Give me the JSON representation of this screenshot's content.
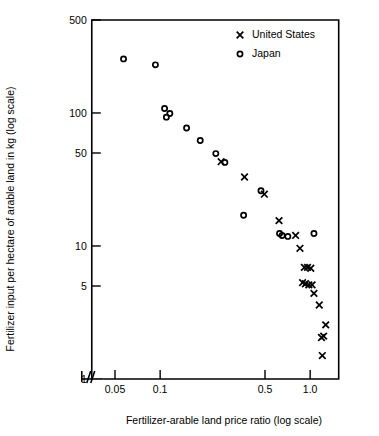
{
  "chart_data": {
    "type": "scatter",
    "title": "",
    "xlabel": "Fertilizer-arable land price ratio (log scale)",
    "ylabel": "Fertilizer input per hectare of arable land in kg (log scale)",
    "xscale": "log",
    "yscale": "log",
    "xlim": [
      0.035,
      1.55
    ],
    "ylim": [
      1,
      500
    ],
    "xticks": [
      0.05,
      0.1,
      0.5,
      1.0
    ],
    "xticklabels": [
      "0.05",
      "0.1",
      "0.5",
      "1.0"
    ],
    "yticks": [
      1,
      5,
      10,
      50,
      100,
      500
    ],
    "yticklabels": [
      "1",
      "5",
      "10",
      "50",
      "100",
      "500"
    ],
    "grid": false,
    "axis_break": true,
    "legend_position": "top-right",
    "series": [
      {
        "name": "United States",
        "marker": "x",
        "color": "#000000",
        "points": [
          [
            0.255,
            43.0
          ],
          [
            0.365,
            33.0
          ],
          [
            0.495,
            24.5
          ],
          [
            0.62,
            15.5
          ],
          [
            0.8,
            12.0
          ],
          [
            0.855,
            9.6
          ],
          [
            0.915,
            6.9
          ],
          [
            0.96,
            6.9
          ],
          [
            1.01,
            6.8
          ],
          [
            0.89,
            5.3
          ],
          [
            0.93,
            5.2
          ],
          [
            0.98,
            5.1
          ],
          [
            1.03,
            5.1
          ],
          [
            1.06,
            4.4
          ],
          [
            1.15,
            3.6
          ],
          [
            1.27,
            2.55
          ],
          [
            1.19,
            2.05
          ],
          [
            1.23,
            2.1
          ],
          [
            1.205,
            1.5
          ]
        ]
      },
      {
        "name": "Japan",
        "marker": "o",
        "color": "#000000",
        "points": [
          [
            0.057,
            255.0
          ],
          [
            0.093,
            230.0
          ],
          [
            0.107,
            108.0
          ],
          [
            0.116,
            99.0
          ],
          [
            0.11,
            93.0
          ],
          [
            0.15,
            77.0
          ],
          [
            0.185,
            62.0
          ],
          [
            0.235,
            49.5
          ],
          [
            0.27,
            42.5
          ],
          [
            0.47,
            26.0
          ],
          [
            0.36,
            17.0
          ],
          [
            0.625,
            12.4
          ],
          [
            0.65,
            12.0
          ],
          [
            0.71,
            11.8
          ],
          [
            1.06,
            12.4
          ]
        ]
      }
    ]
  },
  "legend": {
    "items": [
      {
        "label": "United States",
        "marker": "x"
      },
      {
        "label": "Japan",
        "marker": "o"
      }
    ]
  }
}
